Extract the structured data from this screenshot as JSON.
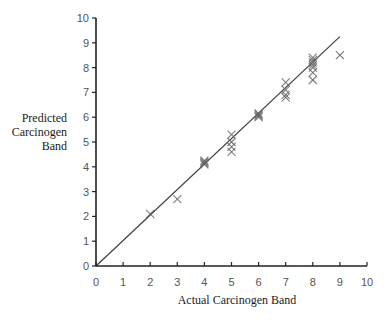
{
  "chart_data": {
    "type": "scatter",
    "title": "",
    "xlabel": "Actual Carcinogen Band",
    "ylabel": [
      "Predicted",
      "Carcinogen",
      "Band"
    ],
    "xlim": [
      0,
      10
    ],
    "ylim": [
      0,
      10
    ],
    "x_ticks": [
      0,
      1,
      2,
      3,
      4,
      5,
      6,
      7,
      8,
      9,
      10
    ],
    "y_ticks": [
      0,
      1,
      2,
      3,
      4,
      5,
      6,
      7,
      8,
      9,
      10
    ],
    "grid": false,
    "legend": null,
    "marker": "x",
    "series": [
      {
        "name": "Predicted vs Actual",
        "points": [
          {
            "x": 2,
            "y": 2.1
          },
          {
            "x": 3,
            "y": 2.7
          },
          {
            "x": 4,
            "y": 4.1
          },
          {
            "x": 4,
            "y": 4.15
          },
          {
            "x": 4,
            "y": 4.2
          },
          {
            "x": 4,
            "y": 4.25
          },
          {
            "x": 5,
            "y": 4.6
          },
          {
            "x": 5,
            "y": 4.8
          },
          {
            "x": 5,
            "y": 5.0
          },
          {
            "x": 5,
            "y": 5.3
          },
          {
            "x": 6,
            "y": 6.0
          },
          {
            "x": 6,
            "y": 6.05
          },
          {
            "x": 6,
            "y": 6.1
          },
          {
            "x": 6,
            "y": 6.15
          },
          {
            "x": 7,
            "y": 6.8
          },
          {
            "x": 7,
            "y": 6.9
          },
          {
            "x": 7,
            "y": 7.1
          },
          {
            "x": 7,
            "y": 7.4
          },
          {
            "x": 8,
            "y": 7.5
          },
          {
            "x": 8,
            "y": 7.8
          },
          {
            "x": 8,
            "y": 8.0
          },
          {
            "x": 8,
            "y": 8.1
          },
          {
            "x": 8,
            "y": 8.2
          },
          {
            "x": 8,
            "y": 8.3
          },
          {
            "x": 8,
            "y": 8.4
          },
          {
            "x": 9,
            "y": 8.5
          }
        ]
      }
    ],
    "fit_line": {
      "x0": 0,
      "y0": 0,
      "x1": 9.0,
      "y1": 9.25
    }
  }
}
